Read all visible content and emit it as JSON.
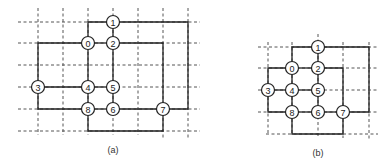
{
  "figure": {
    "panels": [
      {
        "id": "a",
        "caption": "(a)",
        "node_labels": [
          "0",
          "1",
          "2",
          "3",
          "4",
          "5",
          "6",
          "7",
          "8"
        ],
        "nodes": {
          "1": [
            113,
            22
          ],
          "0": [
            88,
            43
          ],
          "2": [
            113,
            43
          ],
          "3": [
            38,
            87
          ],
          "4": [
            88,
            87
          ],
          "5": [
            113,
            87
          ],
          "8": [
            88,
            109
          ],
          "6": [
            113,
            109
          ],
          "7": [
            163,
            109
          ]
        },
        "grid_columns_x": [
          38,
          63,
          88,
          113,
          138,
          163,
          188
        ],
        "grid_rows_y": [
          22,
          43,
          65,
          87,
          109,
          131
        ]
      },
      {
        "id": "b",
        "caption": "(b)",
        "node_labels": [
          "0",
          "1",
          "2",
          "3",
          "4",
          "5",
          "6",
          "7",
          "8"
        ],
        "nodes": {
          "1": [
            318,
            47
          ],
          "0": [
            292,
            68
          ],
          "2": [
            318,
            68
          ],
          "3": [
            268,
            90
          ],
          "4": [
            292,
            90
          ],
          "5": [
            318,
            90
          ],
          "8": [
            292,
            112
          ],
          "6": [
            318,
            112
          ],
          "7": [
            343,
            112
          ]
        },
        "grid_columns_x": [
          268,
          292,
          318,
          343,
          369
        ],
        "grid_rows_y": [
          47,
          68,
          90,
          112,
          134
        ]
      }
    ]
  }
}
